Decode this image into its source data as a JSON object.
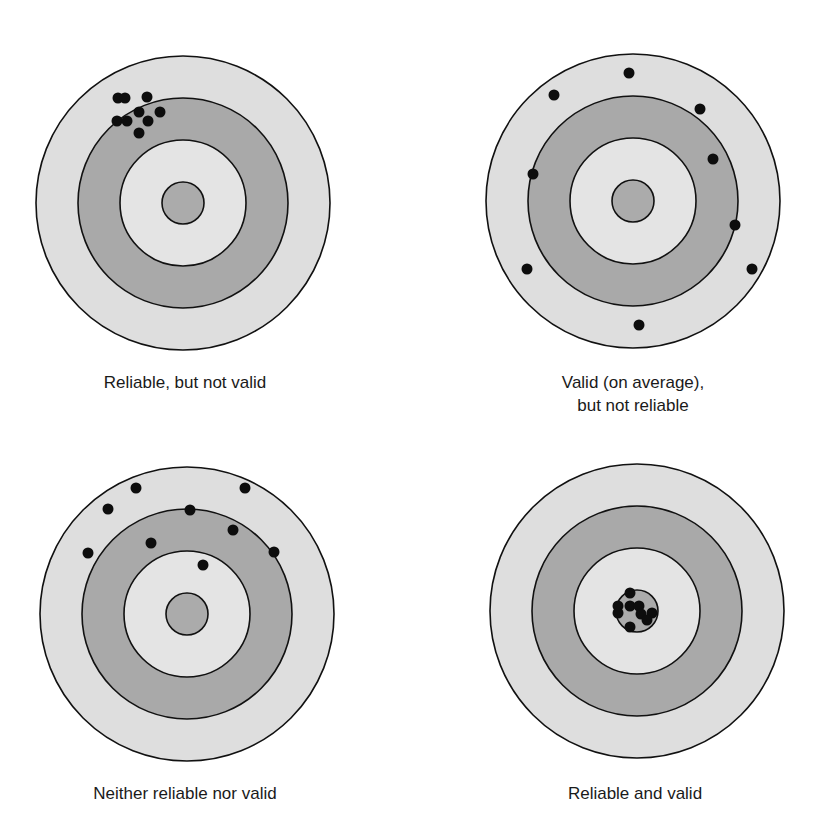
{
  "figure": {
    "colors": {
      "background": "#ffffff",
      "outer_ring": "#dedede",
      "middle_ring": "#a9a9a9",
      "inner_ring": "#e4e4e4",
      "bullseye": "#ababab",
      "outline": "#111111",
      "shot": "#0d0d0d"
    },
    "ring_radii": [
      147,
      105,
      63,
      21
    ],
    "shot_radius": 5.5
  },
  "targets": [
    {
      "id": "reliable-not-valid",
      "label_lines": [
        "Reliable, but not valid"
      ],
      "center": [
        183,
        203
      ],
      "label_pos": [
        185,
        371
      ],
      "shots": [
        [
          118,
          98
        ],
        [
          125,
          98
        ],
        [
          147,
          97
        ],
        [
          139,
          112
        ],
        [
          160,
          112
        ],
        [
          117,
          121
        ],
        [
          127,
          121
        ],
        [
          148,
          121
        ],
        [
          139,
          133
        ]
      ]
    },
    {
      "id": "valid-not-reliable",
      "label_lines": [
        "Valid (on average),",
        "but not reliable"
      ],
      "center": [
        633,
        201
      ],
      "label_pos": [
        633,
        371
      ],
      "shots": [
        [
          629,
          73
        ],
        [
          554,
          95
        ],
        [
          700,
          109
        ],
        [
          713,
          159
        ],
        [
          533,
          174
        ],
        [
          735,
          225
        ],
        [
          527,
          269
        ],
        [
          752,
          269
        ],
        [
          639,
          325
        ]
      ]
    },
    {
      "id": "neither-reliable-nor-valid",
      "label_lines": [
        "Neither reliable nor valid"
      ],
      "center": [
        187,
        614
      ],
      "label_pos": [
        185,
        782
      ],
      "shots": [
        [
          136,
          488
        ],
        [
          245,
          488
        ],
        [
          108,
          509
        ],
        [
          190,
          510
        ],
        [
          233,
          530
        ],
        [
          151,
          543
        ],
        [
          88,
          553
        ],
        [
          274,
          552
        ],
        [
          203,
          565
        ]
      ]
    },
    {
      "id": "reliable-and-valid",
      "label_lines": [
        "Reliable and valid"
      ],
      "center": [
        637,
        611
      ],
      "label_pos": [
        635,
        782
      ],
      "shots": [
        [
          630,
          593
        ],
        [
          618,
          606
        ],
        [
          618,
          613
        ],
        [
          630,
          606
        ],
        [
          639,
          606
        ],
        [
          641,
          614
        ],
        [
          652,
          613
        ],
        [
          647,
          620
        ],
        [
          630,
          627
        ]
      ]
    }
  ]
}
